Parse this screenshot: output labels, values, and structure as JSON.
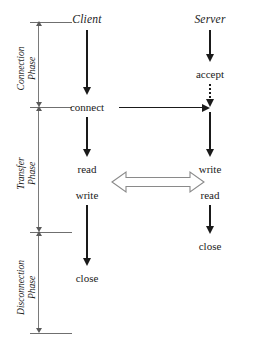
{
  "diagram": {
    "stroke_color": "#1a1a1a",
    "phase_rule_color": "#6f6f6f"
  },
  "columns": [
    {
      "id": "client",
      "label": "Client"
    },
    {
      "id": "server",
      "label": "Server"
    }
  ],
  "phases": [
    {
      "id": "connection",
      "line1": "Connection",
      "line2": "Phase"
    },
    {
      "id": "transfer",
      "line1": "Transfer",
      "line2": "Phase"
    },
    {
      "id": "disconnection",
      "line1": "Disconnection",
      "line2": "Phase"
    }
  ],
  "client_steps": [
    {
      "id": "connect",
      "label": "connect"
    },
    {
      "id": "read",
      "label": "read"
    },
    {
      "id": "write",
      "label": "write"
    },
    {
      "id": "close",
      "label": "close"
    }
  ],
  "server_steps": [
    {
      "id": "accept",
      "label": "accept"
    },
    {
      "id": "write",
      "label": "write"
    },
    {
      "id": "read",
      "label": "read"
    },
    {
      "id": "close",
      "label": "close"
    }
  ],
  "connectors": {
    "connect_request": "connect-request-arrow",
    "accept_dotted": "accept-dotted-arrow",
    "data_exchange": "data-exchange-double-arrow"
  }
}
